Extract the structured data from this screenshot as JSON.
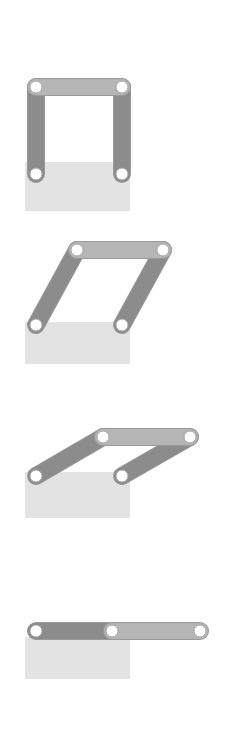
{
  "figure": {
    "canvas": {
      "width": 227,
      "height": 756,
      "background": "#ffffff"
    },
    "colors": {
      "ground_block": "#e3e3e3",
      "link_dark": "#8c8c8c",
      "link_light": "#b5b5b5",
      "link_outline": "#9a9a9a",
      "joint_fill": "#ffffff",
      "joint_stroke": "#a8a8a8"
    },
    "geometry": {
      "link_width": 16,
      "joint_outer_radius": 9,
      "joint_hole_radius": 6
    },
    "frames": [
      {
        "id": "frame-1",
        "label": "Frame 1",
        "pose": "0 degrees — links vertical, upright square",
        "ground": {
          "x": 25,
          "y": 162,
          "width": 105,
          "height": 49
        },
        "joints": [
          {
            "name": "pivot-left",
            "x": 36,
            "y": 174,
            "type": "ground-pivot"
          },
          {
            "name": "pivot-right",
            "x": 122,
            "y": 174,
            "type": "ground-pivot"
          },
          {
            "name": "coupler-left",
            "x": 36,
            "y": 87,
            "type": "moving-pivot"
          },
          {
            "name": "coupler-right",
            "x": 122,
            "y": 87,
            "type": "moving-pivot"
          }
        ],
        "links": [
          {
            "name": "crank-left",
            "from": "pivot-left",
            "to": "coupler-left",
            "shade": "dark"
          },
          {
            "name": "crank-right",
            "from": "pivot-right",
            "to": "coupler-right",
            "shade": "dark"
          },
          {
            "name": "coupler",
            "from": "coupler-left",
            "to": "coupler-right",
            "shade": "light"
          }
        ]
      },
      {
        "id": "frame-2",
        "label": "Frame 2",
        "pose": "approx 40 degrees — links leaning right",
        "ground": {
          "x": 25,
          "y": 322,
          "width": 105,
          "height": 42
        },
        "joints": [
          {
            "name": "pivot-left",
            "x": 36,
            "y": 325,
            "type": "ground-pivot"
          },
          {
            "name": "pivot-right",
            "x": 122,
            "y": 325,
            "type": "ground-pivot"
          },
          {
            "name": "coupler-left",
            "x": 77,
            "y": 250,
            "type": "moving-pivot"
          },
          {
            "name": "coupler-right",
            "x": 163,
            "y": 250,
            "type": "moving-pivot"
          }
        ],
        "links": [
          {
            "name": "crank-left",
            "from": "pivot-left",
            "to": "coupler-left",
            "shade": "dark"
          },
          {
            "name": "crank-right",
            "from": "pivot-right",
            "to": "coupler-right",
            "shade": "dark"
          },
          {
            "name": "coupler",
            "from": "coupler-left",
            "to": "coupler-right",
            "shade": "light"
          }
        ]
      },
      {
        "id": "frame-3",
        "label": "Frame 3",
        "pose": "approx 65 degrees — links near horizontal",
        "ground": {
          "x": 25,
          "y": 472,
          "width": 105,
          "height": 46
        },
        "joints": [
          {
            "name": "pivot-left",
            "x": 36,
            "y": 476,
            "type": "ground-pivot"
          },
          {
            "name": "pivot-right",
            "x": 122,
            "y": 476,
            "type": "ground-pivot"
          },
          {
            "name": "coupler-left",
            "x": 103,
            "y": 437,
            "type": "moving-pivot"
          },
          {
            "name": "coupler-right",
            "x": 190,
            "y": 437,
            "type": "moving-pivot"
          }
        ],
        "links": [
          {
            "name": "crank-left",
            "from": "pivot-left",
            "to": "coupler-left",
            "shade": "dark"
          },
          {
            "name": "crank-right",
            "from": "pivot-right",
            "to": "coupler-right",
            "shade": "dark"
          },
          {
            "name": "coupler",
            "from": "coupler-left",
            "to": "coupler-right",
            "shade": "light"
          }
        ]
      },
      {
        "id": "frame-4",
        "label": "Frame 4",
        "pose": "90 degrees — fully folded, links collinear horizontal",
        "ground": {
          "x": 25,
          "y": 637,
          "width": 105,
          "height": 42
        },
        "joints": [
          {
            "name": "pivot-left",
            "x": 36,
            "y": 631,
            "type": "ground-pivot"
          },
          {
            "name": "pivot-right",
            "x": 112,
            "y": 631,
            "type": "ground-pivot"
          },
          {
            "name": "coupler-left",
            "x": 112,
            "y": 631,
            "type": "moving-pivot"
          },
          {
            "name": "coupler-right",
            "x": 200,
            "y": 631,
            "type": "moving-pivot"
          }
        ],
        "links": [
          {
            "name": "crank-left",
            "from": "pivot-left",
            "to": "coupler-left",
            "shade": "dark"
          },
          {
            "name": "coupler",
            "from": "coupler-left",
            "to": "coupler-right",
            "shade": "light"
          }
        ]
      }
    ]
  }
}
